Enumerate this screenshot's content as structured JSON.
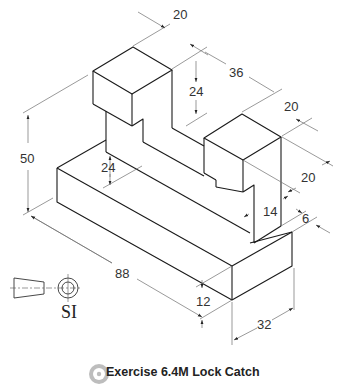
{
  "caption": {
    "title": "Exercise 6.4M Lock Catch",
    "icon": "gear-icon"
  },
  "projection_symbol": {
    "label": "SI",
    "icon": "third-angle-projection-icon"
  },
  "dimensions": {
    "top_width": "20",
    "block_spacing": "36",
    "upper_height": "24",
    "right_block_depth": "20",
    "right_block_width": "20",
    "overall_height": "50",
    "slot_height": "24",
    "notch_height": "14",
    "notch_depth": "6",
    "overall_length": "88",
    "base_height": "12",
    "base_depth": "32"
  },
  "colors": {
    "object_line": "#1a1a1a",
    "dimension_line": "#6e6e6e",
    "text": "#333333"
  }
}
